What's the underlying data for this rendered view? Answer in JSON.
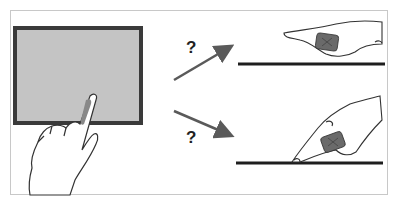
{
  "figure": {
    "labels": {
      "upper_question": "?",
      "lower_question": "?"
    },
    "caption": "",
    "panels": {
      "left": {
        "description": "finger touching touchscreen"
      },
      "top_right": {
        "description": "finger hovering above surface"
      },
      "bottom_right": {
        "description": "finger touching surface"
      }
    },
    "colors": {
      "screen_fill": "#c4c4c4",
      "screen_border": "#3a3a3a",
      "arrow": "#5a5a5a",
      "surface_line": "#1e1e1e",
      "sensor": "#6a6a6a",
      "frame_border": "#c8c8c8"
    }
  }
}
